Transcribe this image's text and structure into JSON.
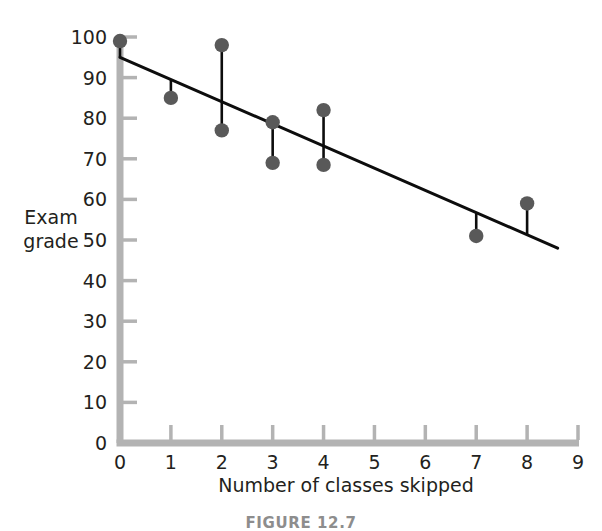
{
  "chart_data": {
    "type": "scatter",
    "title": "",
    "xlabel": "Number of classes skipped",
    "ylabel_line1": "Exam",
    "ylabel_line2": "grade",
    "ylabel": "Exam grade",
    "xlim": [
      0,
      9
    ],
    "ylim": [
      0,
      100
    ],
    "xticks": [
      "0",
      "1",
      "2",
      "3",
      "4",
      "5",
      "6",
      "7",
      "8",
      "9"
    ],
    "xtick_values": [
      0,
      1,
      2,
      3,
      4,
      5,
      6,
      7,
      8,
      9
    ],
    "yticks": [
      "0",
      "10",
      "20",
      "30",
      "40",
      "50",
      "60",
      "70",
      "80",
      "90",
      "100"
    ],
    "ytick_values": [
      0,
      10,
      20,
      30,
      40,
      50,
      60,
      70,
      80,
      90,
      100
    ],
    "grid": false,
    "legend": "none",
    "points": [
      {
        "x": 0,
        "y": 99
      },
      {
        "x": 1,
        "y": 85
      },
      {
        "x": 2,
        "y": 98
      },
      {
        "x": 2,
        "y": 77
      },
      {
        "x": 3,
        "y": 79
      },
      {
        "x": 3,
        "y": 69
      },
      {
        "x": 4,
        "y": 82
      },
      {
        "x": 4,
        "y": 68.5
      },
      {
        "x": 7,
        "y": 51
      },
      {
        "x": 8,
        "y": 59
      }
    ],
    "regression_line": {
      "x_start": 0,
      "y_start": 95,
      "x_end": 8.6,
      "y_end": 48,
      "slope": -5.47,
      "intercept": 95
    },
    "residual_segments": [
      {
        "x": 0,
        "y_point": 99,
        "y_line": 95
      },
      {
        "x": 1,
        "y_point": 85,
        "y_line": 89.5
      },
      {
        "x": 2,
        "y_point": 98,
        "y_line": 84
      },
      {
        "x": 2,
        "y_point": 77,
        "y_line": 84
      },
      {
        "x": 3,
        "y_point": 79,
        "y_line": 78.5
      },
      {
        "x": 3,
        "y_point": 69,
        "y_line": 78.5
      },
      {
        "x": 4,
        "y_point": 82,
        "y_line": 73
      },
      {
        "x": 4,
        "y_point": 68.5,
        "y_line": 73
      },
      {
        "x": 7,
        "y_point": 51,
        "y_line": 56.7
      },
      {
        "x": 8,
        "y_point": 59,
        "y_line": 51.2
      }
    ],
    "colors": {
      "point_fill": "#595959",
      "line": "#0d0d0d",
      "axis": "#b3b3b3",
      "tick": "#b3b3b3",
      "text": "#231f20",
      "background": "#ffffff"
    }
  },
  "caption": {
    "text": "FIGURE 12.7"
  }
}
